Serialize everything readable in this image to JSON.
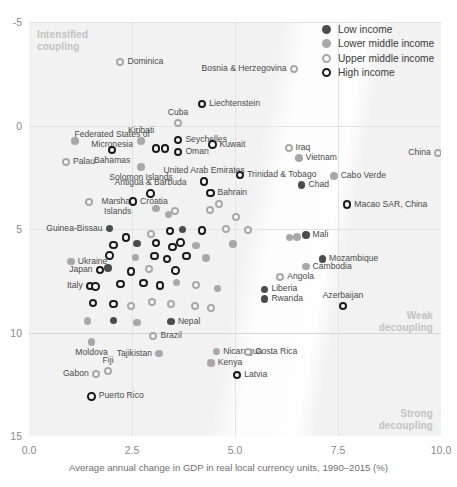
{
  "axes": {
    "y_ticks": [
      "15",
      "10",
      "5",
      "0",
      "-5"
    ],
    "x_ticks": [
      "0.0",
      "2.5",
      "5.0",
      "7.5",
      "10.0"
    ],
    "x_title": "Average annual change in GDP in real local currency units, 1990–2015 (%)",
    "y_title": ""
  },
  "annotations": {
    "intensified": "Intensified\ncoupling",
    "intensified_l1": "Intensified",
    "intensified_l2": "coupling",
    "weak_l1": "Weak",
    "weak_l2": "decoupling",
    "strong_l1": "Strong",
    "strong_l2": "decoupling"
  },
  "legend": {
    "items": [
      {
        "label": "Low income",
        "key": "low",
        "color": "#4c4c4c"
      },
      {
        "label": "Lower middle income",
        "key": "lowermid",
        "color": "#a8a8a8"
      },
      {
        "label": "Upper middle income",
        "key": "uppermid",
        "color": "#a8a8a8"
      },
      {
        "label": "High income",
        "key": "high",
        "color": "#1a1a1a"
      }
    ]
  },
  "chart_data": {
    "type": "scatter",
    "title": "",
    "xlabel": "Average annual change in GDP in real local currency units, 1990–2015 (%)",
    "ylabel": "",
    "xlim": [
      0.0,
      10.0
    ],
    "ylim": [
      -5,
      15
    ],
    "xticks": [
      0.0,
      2.5,
      5.0,
      7.5,
      10.0
    ],
    "yticks": [
      -5,
      0,
      5,
      10,
      15
    ],
    "grid": true,
    "legend_position": "top-right",
    "series": [
      {
        "name": "Low income",
        "marker": "filled-dark"
      },
      {
        "name": "Lower middle income",
        "marker": "filled-grey"
      },
      {
        "name": "Upper middle income",
        "marker": "open-grey"
      },
      {
        "name": "High income",
        "marker": "open-dark"
      }
    ],
    "points": [
      {
        "name": "Dominica",
        "x": 2.22,
        "y": 13.05,
        "g": "uppermid",
        "lab": "right"
      },
      {
        "name": "Bosnia & Herzegovina",
        "x": 6.42,
        "y": 12.75,
        "g": "uppermid",
        "lab": "left"
      },
      {
        "name": "Liechtenstein",
        "x": 4.2,
        "y": 11.05,
        "g": "high",
        "lab": "right"
      },
      {
        "name": "Cuba",
        "x": 3.62,
        "y": 10.12,
        "g": "uppermid",
        "lab": "top"
      },
      {
        "name": "Federated States of Micronesia",
        "x": 1.12,
        "y": 9.25,
        "g": "lowermid",
        "lab": "topright"
      },
      {
        "name": "Kiribati",
        "x": 2.72,
        "y": 9.25,
        "g": "lowermid",
        "lab": "top"
      },
      {
        "name": "Seychelles",
        "x": 3.62,
        "y": 9.3,
        "g": "high",
        "lab": "right"
      },
      {
        "name": "Bahamas",
        "x": 2.02,
        "y": 8.82,
        "g": "high",
        "lab": "bottom"
      },
      {
        "name": "",
        "x": 3.08,
        "y": 8.9,
        "g": "high",
        "lab": "none"
      },
      {
        "name": "",
        "x": 3.3,
        "y": 8.9,
        "g": "high",
        "lab": "none"
      },
      {
        "name": "Oman",
        "x": 3.62,
        "y": 8.72,
        "g": "high",
        "lab": "right"
      },
      {
        "name": "Kuwait",
        "x": 4.45,
        "y": 9.08,
        "g": "high",
        "lab": "right"
      },
      {
        "name": "Iraq",
        "x": 6.3,
        "y": 8.92,
        "g": "uppermid",
        "lab": "right"
      },
      {
        "name": "Palau",
        "x": 0.9,
        "y": 8.22,
        "g": "uppermid",
        "lab": "right"
      },
      {
        "name": "Vietnam",
        "x": 6.55,
        "y": 8.42,
        "g": "lowermid",
        "lab": "right"
      },
      {
        "name": "China",
        "x": 9.92,
        "y": 8.68,
        "g": "uppermid",
        "lab": "left"
      },
      {
        "name": "Solomon Islands",
        "x": 2.72,
        "y": 8.0,
        "g": "lowermid",
        "lab": "bottom"
      },
      {
        "name": "United Arab Emirates",
        "x": 4.25,
        "y": 7.3,
        "g": "high",
        "lab": "top"
      },
      {
        "name": "Trinidad & Tobago",
        "x": 5.12,
        "y": 7.62,
        "g": "high",
        "lab": "right"
      },
      {
        "name": "Cabo Verde",
        "x": 7.4,
        "y": 7.55,
        "g": "lowermid",
        "lab": "right"
      },
      {
        "name": "Chad",
        "x": 6.62,
        "y": 7.12,
        "g": "low",
        "lab": "right"
      },
      {
        "name": "Antigua & Barbuda",
        "x": 2.95,
        "y": 6.72,
        "g": "high",
        "lab": "top"
      },
      {
        "name": "Bahrain",
        "x": 4.4,
        "y": 6.75,
        "g": "high",
        "lab": "right"
      },
      {
        "name": "Marshall Islands",
        "x": 1.45,
        "y": 6.3,
        "g": "uppermid",
        "lab": "rightwrap"
      },
      {
        "name": "Croatia",
        "x": 2.52,
        "y": 6.32,
        "g": "high",
        "lab": "right"
      },
      {
        "name": "Macao SAR, China",
        "x": 7.72,
        "y": 6.18,
        "g": "high",
        "lab": "right"
      },
      {
        "name": "",
        "x": 3.08,
        "y": 5.98,
        "g": "lowermid",
        "lab": "none"
      },
      {
        "name": "",
        "x": 3.38,
        "y": 5.7,
        "g": "lowermid",
        "lab": "none"
      },
      {
        "name": "",
        "x": 3.55,
        "y": 5.85,
        "g": "uppermid",
        "lab": "none"
      },
      {
        "name": "",
        "x": 4.62,
        "y": 6.22,
        "g": "uppermid",
        "lab": "none"
      },
      {
        "name": "",
        "x": 4.4,
        "y": 5.92,
        "g": "uppermid",
        "lab": "none"
      },
      {
        "name": "",
        "x": 5.02,
        "y": 5.58,
        "g": "uppermid",
        "lab": "none"
      },
      {
        "name": "Guinea-Bissau",
        "x": 1.95,
        "y": 5.02,
        "g": "low",
        "lab": "left"
      },
      {
        "name": "",
        "x": 2.35,
        "y": 4.58,
        "g": "high",
        "lab": "none"
      },
      {
        "name": "",
        "x": 2.95,
        "y": 4.78,
        "g": "uppermid",
        "lab": "none"
      },
      {
        "name": "",
        "x": 3.42,
        "y": 4.9,
        "g": "high",
        "lab": "none"
      },
      {
        "name": "",
        "x": 3.72,
        "y": 4.98,
        "g": "low",
        "lab": "none"
      },
      {
        "name": "",
        "x": 4.2,
        "y": 4.92,
        "g": "high",
        "lab": "none"
      },
      {
        "name": "",
        "x": 4.78,
        "y": 5.0,
        "g": "uppermid",
        "lab": "none"
      },
      {
        "name": "",
        "x": 5.32,
        "y": 4.95,
        "g": "uppermid",
        "lab": "none"
      },
      {
        "name": "Mali",
        "x": 6.72,
        "y": 4.72,
        "g": "low",
        "lab": "right"
      },
      {
        "name": "",
        "x": 6.5,
        "y": 4.62,
        "g": "lowermid",
        "lab": "none"
      },
      {
        "name": "",
        "x": 6.32,
        "y": 4.58,
        "g": "lowermid",
        "lab": "none"
      },
      {
        "name": "",
        "x": 2.05,
        "y": 4.22,
        "g": "high",
        "lab": "none"
      },
      {
        "name": "",
        "x": 2.62,
        "y": 4.3,
        "g": "low",
        "lab": "none"
      },
      {
        "name": "",
        "x": 3.08,
        "y": 4.32,
        "g": "high",
        "lab": "none"
      },
      {
        "name": "",
        "x": 3.48,
        "y": 4.12,
        "g": "high",
        "lab": "none"
      },
      {
        "name": "",
        "x": 3.68,
        "y": 4.35,
        "g": "high",
        "lab": "none"
      },
      {
        "name": "",
        "x": 4.05,
        "y": 4.2,
        "g": "lowermid",
        "lab": "none"
      },
      {
        "name": "",
        "x": 4.95,
        "y": 4.28,
        "g": "lowermid",
        "lab": "none"
      },
      {
        "name": "Mozambique",
        "x": 7.12,
        "y": 3.55,
        "g": "low",
        "lab": "right"
      },
      {
        "name": "Cambodia",
        "x": 6.72,
        "y": 3.18,
        "g": "lowermid",
        "lab": "right"
      },
      {
        "name": "Ukraine",
        "x": 1.02,
        "y": 3.42,
        "g": "lowermid",
        "lab": "right"
      },
      {
        "name": "",
        "x": 1.95,
        "y": 3.72,
        "g": "high",
        "lab": "none"
      },
      {
        "name": "",
        "x": 2.58,
        "y": 3.62,
        "g": "lowermid",
        "lab": "none"
      },
      {
        "name": "",
        "x": 3.05,
        "y": 3.7,
        "g": "high",
        "lab": "none"
      },
      {
        "name": "",
        "x": 3.35,
        "y": 3.55,
        "g": "high",
        "lab": "none"
      },
      {
        "name": "",
        "x": 3.82,
        "y": 3.7,
        "g": "high",
        "lab": "none"
      },
      {
        "name": "",
        "x": 4.3,
        "y": 3.6,
        "g": "lowermid",
        "lab": "none"
      },
      {
        "name": "Japan",
        "x": 1.72,
        "y": 3.02,
        "g": "high",
        "lab": "left"
      },
      {
        "name": "",
        "x": 1.92,
        "y": 3.12,
        "g": "low",
        "lab": "none"
      },
      {
        "name": "",
        "x": 2.48,
        "y": 2.95,
        "g": "high",
        "lab": "none"
      },
      {
        "name": "",
        "x": 2.92,
        "y": 3.05,
        "g": "uppermid",
        "lab": "none"
      },
      {
        "name": "",
        "x": 3.55,
        "y": 3.0,
        "g": "high",
        "lab": "none"
      },
      {
        "name": "Angola",
        "x": 6.1,
        "y": 2.68,
        "g": "uppermid",
        "lab": "right"
      },
      {
        "name": "Italy",
        "x": 1.48,
        "y": 2.25,
        "g": "high",
        "lab": "left"
      },
      {
        "name": "",
        "x": 1.62,
        "y": 2.22,
        "g": "high",
        "lab": "none"
      },
      {
        "name": "",
        "x": 2.22,
        "y": 2.35,
        "g": "high",
        "lab": "none"
      },
      {
        "name": "",
        "x": 2.78,
        "y": 2.4,
        "g": "high",
        "lab": "none"
      },
      {
        "name": "",
        "x": 3.18,
        "y": 2.28,
        "g": "high",
        "lab": "none"
      },
      {
        "name": "",
        "x": 3.58,
        "y": 2.42,
        "g": "lowermid",
        "lab": "none"
      },
      {
        "name": "",
        "x": 4.05,
        "y": 2.3,
        "g": "uppermid",
        "lab": "none"
      },
      {
        "name": "",
        "x": 4.58,
        "y": 2.12,
        "g": "lowermid",
        "lab": "none"
      },
      {
        "name": "Liberia",
        "x": 5.72,
        "y": 2.08,
        "g": "low",
        "lab": "right"
      },
      {
        "name": "Rwanda",
        "x": 5.72,
        "y": 1.62,
        "g": "low",
        "lab": "right"
      },
      {
        "name": "",
        "x": 1.55,
        "y": 1.42,
        "g": "high",
        "lab": "none"
      },
      {
        "name": "",
        "x": 2.05,
        "y": 1.38,
        "g": "high",
        "lab": "none"
      },
      {
        "name": "",
        "x": 2.48,
        "y": 1.3,
        "g": "uppermid",
        "lab": "none"
      },
      {
        "name": "",
        "x": 2.98,
        "y": 1.45,
        "g": "uppermid",
        "lab": "none"
      },
      {
        "name": "",
        "x": 3.45,
        "y": 1.4,
        "g": "uppermid",
        "lab": "none"
      },
      {
        "name": "",
        "x": 4.02,
        "y": 1.3,
        "g": "uppermid",
        "lab": "none"
      },
      {
        "name": "",
        "x": 4.42,
        "y": 1.18,
        "g": "uppermid",
        "lab": "none"
      },
      {
        "name": "Azerbaijan",
        "x": 7.62,
        "y": 1.28,
        "g": "high",
        "lab": "top"
      },
      {
        "name": "Nepal",
        "x": 3.45,
        "y": 0.52,
        "g": "low",
        "lab": "right"
      },
      {
        "name": "",
        "x": 2.05,
        "y": 0.58,
        "g": "low",
        "lab": "none"
      },
      {
        "name": "",
        "x": 2.62,
        "y": 0.48,
        "g": "lowermid",
        "lab": "none"
      },
      {
        "name": "",
        "x": 1.42,
        "y": 0.55,
        "g": "lowermid",
        "lab": "none"
      },
      {
        "name": "Brazil",
        "x": 3.02,
        "y": -0.18,
        "g": "uppermid",
        "lab": "right"
      },
      {
        "name": "Moldova",
        "x": 1.52,
        "y": -0.45,
        "g": "lowermid",
        "lab": "bottom"
      },
      {
        "name": "Nicaragua",
        "x": 4.55,
        "y": -0.92,
        "g": "lowermid",
        "lab": "right"
      },
      {
        "name": "Costa Rica",
        "x": 5.32,
        "y": -0.95,
        "g": "uppermid",
        "lab": "right"
      },
      {
        "name": "Tajikistan",
        "x": 3.15,
        "y": -1.02,
        "g": "lowermid",
        "lab": "left"
      },
      {
        "name": "Kenya",
        "x": 4.42,
        "y": -1.48,
        "g": "lowermid",
        "lab": "right"
      },
      {
        "name": "Fiji",
        "x": 1.92,
        "y": -1.85,
        "g": "uppermid",
        "lab": "top"
      },
      {
        "name": "Gabon",
        "x": 1.62,
        "y": -2.02,
        "g": "uppermid",
        "lab": "left"
      },
      {
        "name": "Latvia",
        "x": 5.05,
        "y": -2.05,
        "g": "high",
        "lab": "right"
      },
      {
        "name": "Puerto Rico",
        "x": 1.52,
        "y": -3.08,
        "g": "high",
        "lab": "right"
      }
    ]
  }
}
